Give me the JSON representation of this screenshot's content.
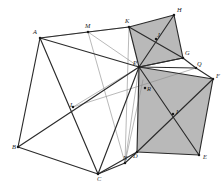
{
  "figure": {
    "kind": "geometry-diagram",
    "background_color": "#ffffff",
    "shade_color": "#b9b9b9",
    "edge_color": "#2b2b2b",
    "thin_edge_color": "#8d8d8d"
  },
  "points": {
    "A": {
      "label": "A",
      "x": 40,
      "y": 38,
      "lx": 33,
      "ly": 33
    },
    "B": {
      "label": "B",
      "x": 18,
      "y": 147,
      "lx": 12,
      "ly": 148
    },
    "C": {
      "label": "C",
      "x": 98,
      "y": 174,
      "lx": 97,
      "ly": 180
    },
    "D": {
      "label": "D",
      "x": 137,
      "y": 152,
      "lx": 133,
      "ly": 157
    },
    "E": {
      "label": "E",
      "x": 199,
      "y": 155,
      "lx": 203,
      "ly": 158
    },
    "F": {
      "label": "F",
      "x": 213,
      "y": 79,
      "lx": 216,
      "ly": 77
    },
    "G": {
      "label": "G",
      "x": 183,
      "y": 58,
      "lx": 185,
      "ly": 54
    },
    "H": {
      "label": "H",
      "x": 174,
      "y": 15,
      "lx": 177,
      "ly": 11
    },
    "K": {
      "label": "K",
      "x": 129,
      "y": 27,
      "lx": 125,
      "ly": 22
    },
    "M": {
      "label": "M",
      "x": 88,
      "y": 32,
      "lx": 85,
      "ly": 27
    },
    "P": {
      "label": "P",
      "x": 139,
      "y": 67,
      "lx": 133,
      "ly": 64
    },
    "J": {
      "label": "J",
      "x": 156,
      "y": 39,
      "lx": 157,
      "ly": 36
    },
    "I": {
      "label": "I",
      "x": 173,
      "y": 114,
      "lx": 176,
      "ly": 113
    },
    "L": {
      "label": "L",
      "x": 73,
      "y": 107,
      "lx": 70,
      "ly": 106
    },
    "N": {
      "label": "N",
      "x": 125,
      "y": 163,
      "lx": 123,
      "ly": 159
    },
    "Q": {
      "label": "Q",
      "x": 196,
      "y": 68,
      "lx": 197,
      "ly": 65
    },
    "R": {
      "label": "R",
      "x": 145,
      "y": 88,
      "lx": 147,
      "ly": 90
    },
    "S": {
      "label": "S",
      "x": 143,
      "y": 80,
      "lx": 145,
      "ly": 80
    }
  },
  "shaded_regions": [
    {
      "name": "upper-right-quad",
      "vertices": [
        "P",
        "K",
        "H",
        "G"
      ]
    },
    {
      "name": "lower-right-quad",
      "vertices": [
        "P",
        "F",
        "E",
        "D"
      ]
    }
  ],
  "main_edges": [
    [
      "A",
      "B"
    ],
    [
      "B",
      "C"
    ],
    [
      "C",
      "D"
    ],
    [
      "A",
      "M"
    ],
    [
      "M",
      "K"
    ],
    [
      "K",
      "P"
    ],
    [
      "K",
      "H"
    ],
    [
      "H",
      "G"
    ],
    [
      "G",
      "P"
    ],
    [
      "P",
      "H"
    ],
    [
      "K",
      "G"
    ],
    [
      "P",
      "F"
    ],
    [
      "F",
      "E"
    ],
    [
      "E",
      "D"
    ],
    [
      "D",
      "P"
    ],
    [
      "P",
      "E"
    ],
    [
      "D",
      "F"
    ],
    [
      "A",
      "P"
    ],
    [
      "A",
      "C"
    ],
    [
      "B",
      "P"
    ],
    [
      "P",
      "C"
    ],
    [
      "C",
      "N"
    ],
    [
      "N",
      "D"
    ],
    [
      "G",
      "Q"
    ],
    [
      "Q",
      "F"
    ],
    [
      "P",
      "G"
    ],
    [
      "P",
      "Q"
    ]
  ],
  "thin_edges": [
    [
      "M",
      "P"
    ],
    [
      "M",
      "N"
    ],
    [
      "K",
      "N"
    ],
    [
      "P",
      "N"
    ],
    [
      "A",
      "K"
    ],
    [
      "L",
      "Q"
    ],
    [
      "P",
      "L"
    ],
    [
      "S",
      "N"
    ]
  ],
  "vertex_order": [
    "A",
    "B",
    "C",
    "D",
    "E",
    "F",
    "G",
    "H",
    "I",
    "J",
    "K",
    "L",
    "M",
    "N",
    "P",
    "Q",
    "R"
  ]
}
